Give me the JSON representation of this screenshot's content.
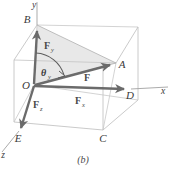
{
  "figure": {
    "caption": "(b)",
    "colors": {
      "background": "#ffffff",
      "cube_edge": "#b9b9b9",
      "cube_edge_dark": "#9a9a9a",
      "vector_arrow": "#6b6b6b",
      "vector_arrow_dark": "#5a5a5a",
      "shaded_triangle": "#e3e3e3",
      "label_text": "#3a3a3a",
      "axis_line": "#9a9a9a"
    },
    "axes": [
      {
        "name": "x-axis",
        "label": "x"
      },
      {
        "name": "y-axis",
        "label": "y"
      },
      {
        "name": "z-axis",
        "label": "z"
      }
    ],
    "vertices": [
      {
        "name": "origin",
        "label": "O"
      },
      {
        "name": "point-a",
        "label": "A"
      },
      {
        "name": "point-b",
        "label": "B"
      },
      {
        "name": "point-c",
        "label": "C"
      },
      {
        "name": "point-d",
        "label": "D"
      },
      {
        "name": "point-e",
        "label": "E"
      }
    ],
    "vectors": [
      {
        "name": "resultant-force",
        "symbol": "F",
        "subscript": ""
      },
      {
        "name": "x-component",
        "symbol": "F",
        "subscript": "x"
      },
      {
        "name": "y-component",
        "symbol": "F",
        "subscript": "y"
      },
      {
        "name": "z-component",
        "symbol": "F",
        "subscript": "z"
      }
    ],
    "angles": [
      {
        "name": "theta-y",
        "symbol": "θ",
        "subscript": "y"
      }
    ]
  }
}
